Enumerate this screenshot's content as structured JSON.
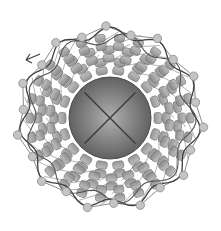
{
  "figure": {
    "width": 221,
    "height": 231,
    "background": "#ffffff",
    "center": [
      110,
      118
    ],
    "core": {
      "label_icon": "x-cross-icon",
      "radius": 41,
      "fill_light": "#a9a9a9",
      "fill_dark": "#5e5e5e",
      "stroke": "#4a4a4a"
    },
    "bead_rings": [
      {
        "radius": 52,
        "count": 18,
        "size": [
          11,
          8
        ]
      },
      {
        "radius": 64,
        "count": 22,
        "size": [
          11,
          8
        ]
      },
      {
        "radius": 76,
        "count": 26,
        "size": [
          10,
          8
        ]
      }
    ],
    "node_ring": {
      "radius": 91,
      "count": 22,
      "node_radius": 4.2
    },
    "colors": {
      "bead_fill": "#9a9a9a",
      "bead_stroke": "#6f6f6f",
      "node_fill": "#c4c4c4",
      "node_stroke": "#8a8a8a",
      "link": "#8c8c8c",
      "chain": "#3e3e3e"
    },
    "arrow": {
      "icon": "arrow-left-icon",
      "tip": [
        26,
        60
      ]
    }
  }
}
